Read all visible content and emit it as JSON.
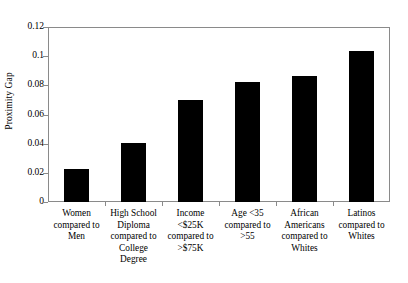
{
  "chart_data": {
    "type": "bar",
    "title": "",
    "xlabel": "",
    "ylabel": "Proximity Gap",
    "ylim": [
      0,
      0.12
    ],
    "grid": false,
    "legend": null,
    "y_ticks": [
      "0",
      "0.02",
      "0.04",
      "0.06",
      "0.08",
      "0.1",
      "0.12"
    ],
    "y_tick_values": [
      0,
      0.02,
      0.04,
      0.06,
      0.08,
      0.1,
      0.12
    ],
    "categories": [
      "Women\ncompared to\nMen",
      "High School\nDiploma\ncompared to\nCollege\nDegree",
      "Income\n<$25K\ncompared to\n>$75K",
      "Age <35\ncompared to\n>55",
      "African\nAmericans\ncompared to\nWhites",
      "Latinos\ncompared to\nWhites"
    ],
    "values": [
      0.0225,
      0.0405,
      0.07,
      0.0825,
      0.0865,
      0.1035
    ],
    "bar_color": "#000000"
  }
}
